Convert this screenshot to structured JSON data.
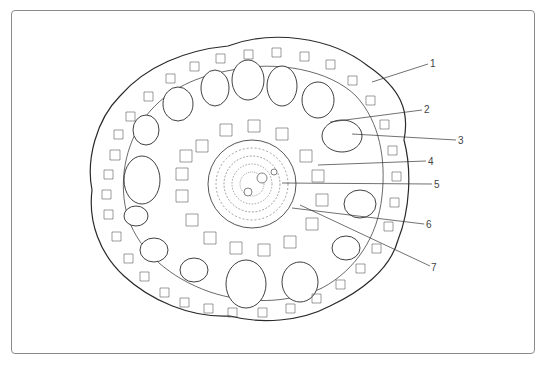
{
  "figure": {
    "type": "plant stem cross-section diagram",
    "labels": [
      {
        "id": "1",
        "text": "1",
        "x": 430,
        "y": 60,
        "tx": 372,
        "ty": 82
      },
      {
        "id": "2",
        "text": "2",
        "x": 424,
        "y": 106,
        "tx": 330,
        "ty": 122
      },
      {
        "id": "3",
        "text": "3",
        "x": 458,
        "y": 136,
        "tx": 352,
        "ty": 134
      },
      {
        "id": "4",
        "text": "4",
        "x": 428,
        "y": 157,
        "tx": 318,
        "ty": 165
      },
      {
        "id": "5",
        "text": "5",
        "x": 434,
        "y": 180,
        "tx": 282,
        "ty": 183
      },
      {
        "id": "6",
        "text": "6",
        "x": 426,
        "y": 220,
        "tx": 292,
        "ty": 208
      },
      {
        "id": "7",
        "text": "7",
        "x": 431,
        "y": 263,
        "tx": 300,
        "ty": 205
      }
    ]
  }
}
